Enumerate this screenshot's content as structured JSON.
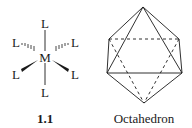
{
  "structure": {
    "center_atom": "M",
    "ligands": [
      "L",
      "L",
      "L",
      "L",
      "L",
      "L"
    ],
    "compound_label": "1.1"
  },
  "polyhedron": {
    "caption": "Octahedron"
  },
  "colors": {
    "line": "#1a1a1a",
    "background": "#ffffff"
  }
}
